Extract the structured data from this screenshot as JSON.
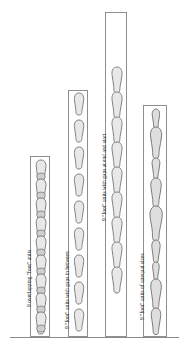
{
  "figure": {
    "background_color": "#ffffff",
    "baseline_color": "#8a8a8a",
    "column_border_color": "#8e8e8e",
    "footprint_fill": "#e8e8e8",
    "footprint_stroke": "#767676",
    "width_px": 185,
    "height_px": 351
  },
  "columns": [
    {
      "id": "column-1",
      "caption": "9 overlapping \"foot\" units",
      "arrangement": "overlapping",
      "unit_count": 9,
      "equal_sizes": true,
      "gaps": "none, units overlap",
      "left_px": 30,
      "top_px": 156,
      "width_px": 20,
      "height_px": 180,
      "units": [
        {
          "index": 1,
          "center_y": 170,
          "length": 24,
          "overlap": 6
        },
        {
          "index": 2,
          "center_y": 189,
          "length": 24,
          "overlap": 6
        },
        {
          "index": 3,
          "center_y": 208,
          "length": 24,
          "overlap": 6
        },
        {
          "index": 4,
          "center_y": 227,
          "length": 24,
          "overlap": 6
        },
        {
          "index": 5,
          "center_y": 246,
          "length": 24,
          "overlap": 6
        },
        {
          "index": 6,
          "center_y": 265,
          "length": 24,
          "overlap": 6
        },
        {
          "index": 7,
          "center_y": 284,
          "length": 24,
          "overlap": 6
        },
        {
          "index": 8,
          "center_y": 303,
          "length": 24,
          "overlap": 6
        },
        {
          "index": 9,
          "center_y": 322,
          "length": 24,
          "overlap": 6
        }
      ]
    },
    {
      "id": "column-2",
      "caption": "9 \"foot\" units with gaps in between",
      "arrangement": "gaps-in-between",
      "unit_count": 9,
      "equal_sizes": true,
      "gaps": "even gaps between every unit",
      "left_px": 68,
      "top_px": 90,
      "width_px": 20,
      "height_px": 246,
      "units": [
        {
          "index": 1,
          "center_y": 103,
          "length": 22,
          "gap_after": 5
        },
        {
          "index": 2,
          "center_y": 130,
          "length": 22,
          "gap_after": 5
        },
        {
          "index": 3,
          "center_y": 157,
          "length": 22,
          "gap_after": 5
        },
        {
          "index": 4,
          "center_y": 184,
          "length": 22,
          "gap_after": 5
        },
        {
          "index": 5,
          "center_y": 211,
          "length": 22,
          "gap_after": 5
        },
        {
          "index": 6,
          "center_y": 238,
          "length": 22,
          "gap_after": 5
        },
        {
          "index": 7,
          "center_y": 265,
          "length": 22,
          "gap_after": 5
        },
        {
          "index": 8,
          "center_y": 292,
          "length": 22,
          "gap_after": 5
        },
        {
          "index": 9,
          "center_y": 319,
          "length": 22,
          "gap_after": 0
        }
      ]
    },
    {
      "id": "column-3",
      "caption": "9 \"foot\" units with gaps at end and start",
      "arrangement": "gaps-at-ends",
      "unit_count": 9,
      "equal_sizes": true,
      "gaps": "large empty space at top and bottom, units contiguous",
      "left_px": 105,
      "top_px": 12,
      "width_px": 22,
      "height_px": 324,
      "units": [
        {
          "index": 1,
          "center_y": 78,
          "length": 25
        },
        {
          "index": 2,
          "center_y": 103,
          "length": 25
        },
        {
          "index": 3,
          "center_y": 128,
          "length": 25
        },
        {
          "index": 4,
          "center_y": 153,
          "length": 25
        },
        {
          "index": 5,
          "center_y": 178,
          "length": 25
        },
        {
          "index": 6,
          "center_y": 203,
          "length": 25
        },
        {
          "index": 7,
          "center_y": 228,
          "length": 25
        },
        {
          "index": 8,
          "center_y": 253,
          "length": 25
        },
        {
          "index": 9,
          "center_y": 278,
          "length": 25
        }
      ]
    },
    {
      "id": "column-4",
      "caption": "9 \"foot\" units of unequal sizes",
      "arrangement": "unequal-sizes",
      "unit_count": 9,
      "equal_sizes": false,
      "gaps": "none, units vary in length and width",
      "left_px": 143,
      "top_px": 105,
      "width_px": 24,
      "height_px": 231,
      "units": [
        {
          "index": 1,
          "center_y": 119,
          "length": 22,
          "scale": 0.8
        },
        {
          "index": 2,
          "center_y": 145,
          "length": 30,
          "scale": 1.15
        },
        {
          "index": 3,
          "center_y": 171,
          "length": 22,
          "scale": 0.85
        },
        {
          "index": 4,
          "center_y": 196,
          "length": 28,
          "scale": 1.05
        },
        {
          "index": 5,
          "center_y": 223,
          "length": 32,
          "scale": 1.25
        },
        {
          "index": 6,
          "center_y": 249,
          "length": 24,
          "scale": 0.9
        },
        {
          "index": 7,
          "center_y": 272,
          "length": 20,
          "scale": 0.75
        },
        {
          "index": 8,
          "center_y": 297,
          "length": 30,
          "scale": 1.15
        },
        {
          "index": 9,
          "center_y": 323,
          "length": 26,
          "scale": 1.0
        }
      ]
    }
  ],
  "captions": {
    "column_1": "9 overlapping \"foot\" units",
    "column_2": "9 \"foot\" units with gaps in between",
    "column_3": "9 \"foot\" units with gaps at end and start",
    "column_4": "9 \"foot\" units of unequal sizes"
  }
}
